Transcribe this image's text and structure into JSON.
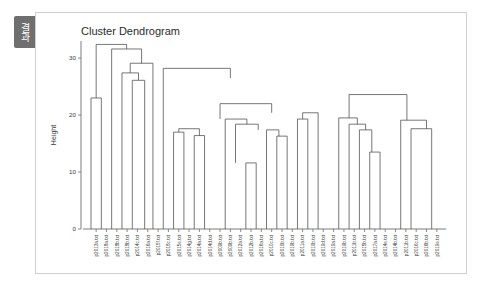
{
  "window": {
    "tab_label": "결과"
  },
  "chart_data": {
    "type": "dendrogram",
    "title": "Cluster Dendrogram",
    "xlabel": "",
    "ylabel": "Height",
    "ylim": [
      0,
      33
    ],
    "yticks": [
      0,
      10,
      20,
      30
    ],
    "ytick_labels": [
      "0",
      "10",
      "20",
      "30"
    ],
    "grid": false,
    "legend": "none",
    "leaf_labels": [
      "p2013a.txt",
      "p2018a.txt",
      "p2018b.txt",
      "p2018b.txt",
      "p2014c.txt",
      "p2016a.txt",
      "p2015f.txt",
      "p2018c.txt",
      "p2015e.txt",
      "p2014g.txt",
      "p2014a.txt",
      "p2014d.txt",
      "p2009b.txt",
      "p2009b.txt",
      "p2012a.txt",
      "p2012b.txt",
      "p2016a.txt",
      "p2010c.txt",
      "p2010b.txt",
      "p2019b.txt",
      "p2011a.txt",
      "p2010b.txt",
      "p2019d.txt",
      "p2019a.txt",
      "p2019b.txt",
      "p2011b.txt",
      "p2015b.txt",
      "p2017a.txt",
      "p2014e.txt",
      "p2014b.txt",
      "p2011b.txt",
      "p2016c.txt",
      "p2016b.txt",
      "p2019e.txt"
    ],
    "merges": [
      {
        "left_x": 0.5,
        "right_x": 3.45,
        "left_h": 23.0,
        "right_h": 31.6,
        "height": 32.4
      },
      {
        "left_x": 0.0,
        "right_x": 1.0,
        "left_h": 0.0,
        "right_h": 0.0,
        "height": 23.0
      },
      {
        "left_x": 2.0,
        "right_x": 4.9,
        "left_h": 0.0,
        "right_h": 29.1,
        "height": 31.6
      },
      {
        "left_x": 3.8,
        "right_x": 6.0,
        "left_h": 27.4,
        "right_h": 0.0,
        "height": 29.1
      },
      {
        "left_x": 3.0,
        "right_x": 4.6,
        "left_h": 0.0,
        "right_h": 26.1,
        "height": 27.4
      },
      {
        "left_x": 4.0,
        "right_x": 5.2,
        "left_h": 0.0,
        "right_h": 0.0,
        "height": 26.1
      },
      {
        "left_x": 7.0,
        "right_x": 13.5,
        "left_h": 0.0,
        "right_h": 26.5,
        "height": 28.2
      },
      {
        "left_x": 8.5,
        "right_x": 10.5,
        "left_h": 17.0,
        "right_h": 16.4,
        "height": 17.6
      },
      {
        "left_x": 8.0,
        "right_x": 9.0,
        "left_h": 0.0,
        "right_h": 0.0,
        "height": 17.0
      },
      {
        "left_x": 10.0,
        "right_x": 11.0,
        "left_h": 0.0,
        "right_h": 0.0,
        "height": 16.4
      },
      {
        "left_x": 12.5,
        "right_x": 17.5,
        "left_h": 19.3,
        "right_h": 20.4,
        "height": 22.0
      },
      {
        "left_x": 13.0,
        "right_x": 15.1,
        "left_h": 0.0,
        "right_h": 18.4,
        "height": 19.3
      },
      {
        "left_x": 14.0,
        "right_x": 16.2,
        "left_h": 11.6,
        "right_h": 17.4,
        "height": 18.4
      },
      {
        "left_x": 15.0,
        "right_x": 16.0,
        "left_h": 0.0,
        "right_h": 0.0,
        "height": 11.6
      },
      {
        "left_x": 17.0,
        "right_x": 18.2,
        "left_h": 0.0,
        "right_h": 16.3,
        "height": 17.4
      },
      {
        "left_x": 18.0,
        "right_x": 19.0,
        "left_h": 0.0,
        "right_h": 0.0,
        "height": 16.3
      },
      {
        "left_x": 20.5,
        "right_x": 22.0,
        "left_h": 19.3,
        "right_h": 0.0,
        "height": 20.4
      },
      {
        "left_x": 20.0,
        "right_x": 21.0,
        "left_h": 0.0,
        "right_h": 0.0,
        "height": 19.3
      },
      {
        "left_x": 25.0,
        "right_x": 30.6,
        "left_h": 19.5,
        "right_h": 19.1,
        "height": 23.6
      },
      {
        "left_x": 24.0,
        "right_x": 25.8,
        "left_h": 0.0,
        "right_h": 18.4,
        "height": 19.5
      },
      {
        "left_x": 25.0,
        "right_x": 26.6,
        "left_h": 0.0,
        "right_h": 17.4,
        "height": 18.4
      },
      {
        "left_x": 26.0,
        "right_x": 27.2,
        "left_h": 0.0,
        "right_h": 13.5,
        "height": 17.4
      },
      {
        "left_x": 27.0,
        "right_x": 28.0,
        "left_h": 0.0,
        "right_h": 0.0,
        "height": 13.5
      },
      {
        "left_x": 30.0,
        "right_x": 32.5,
        "left_h": 0.0,
        "right_h": 17.6,
        "height": 19.1
      },
      {
        "left_x": 31.0,
        "right_x": 33.0,
        "left_h": 0.0,
        "right_h": 0.0,
        "height": 17.6
      }
    ]
  }
}
